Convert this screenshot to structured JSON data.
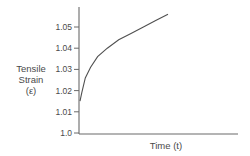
{
  "chart_data": {
    "type": "line",
    "title": "",
    "xlabel": "Time (t)",
    "ylabel": [
      "Tensile",
      "Strain",
      "(ε)"
    ],
    "yticks": [
      "1.0",
      "1.01",
      "1.02",
      "1.03",
      "1.04",
      "1.05"
    ],
    "ytick_values": [
      1.0,
      1.01,
      1.02,
      1.03,
      1.04,
      1.05
    ],
    "xticks": [],
    "ylim": [
      1.0,
      1.06
    ],
    "grid": false,
    "legend": null,
    "series": [
      {
        "name": "Tensile Strain",
        "x": [
          0.0,
          0.02,
          0.06,
          0.12,
          0.2,
          0.31,
          0.44,
          0.58,
          0.72,
          0.86,
          1.0
        ],
        "values": [
          1.015,
          1.019,
          1.026,
          1.031,
          1.036,
          1.04,
          1.044,
          1.047,
          1.05,
          1.053,
          1.056
        ]
      }
    ]
  }
}
